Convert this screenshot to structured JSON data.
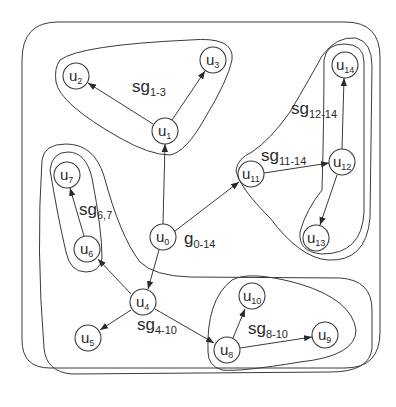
{
  "diagram": {
    "type": "hierarchical-subgraph-graph",
    "graph_label": {
      "main": "g",
      "sub": "0-14",
      "x": 184,
      "y": 244
    },
    "nodes": [
      {
        "id": "u0",
        "main": "u",
        "sub": "0",
        "x": 163,
        "y": 237
      },
      {
        "id": "u1",
        "main": "u",
        "sub": "1",
        "x": 165,
        "y": 131
      },
      {
        "id": "u2",
        "main": "u",
        "sub": "2",
        "x": 76,
        "y": 76
      },
      {
        "id": "u3",
        "main": "u",
        "sub": "3",
        "x": 213,
        "y": 60
      },
      {
        "id": "u4",
        "main": "u",
        "sub": "4",
        "x": 143,
        "y": 302
      },
      {
        "id": "u5",
        "main": "u",
        "sub": "5",
        "x": 88,
        "y": 338
      },
      {
        "id": "u6",
        "main": "u",
        "sub": "6",
        "x": 87,
        "y": 249
      },
      {
        "id": "u7",
        "main": "u",
        "sub": "7",
        "x": 67,
        "y": 175
      },
      {
        "id": "u8",
        "main": "u",
        "sub": "8",
        "x": 227,
        "y": 350
      },
      {
        "id": "u9",
        "main": "u",
        "sub": "9",
        "x": 325,
        "y": 335
      },
      {
        "id": "u10",
        "main": "u",
        "sub": "10",
        "x": 252,
        "y": 296
      },
      {
        "id": "u11",
        "main": "u",
        "sub": "11",
        "x": 251,
        "y": 174
      },
      {
        "id": "u12",
        "main": "u",
        "sub": "12",
        "x": 342,
        "y": 162
      },
      {
        "id": "u13",
        "main": "u",
        "sub": "13",
        "x": 316,
        "y": 238
      },
      {
        "id": "u14",
        "main": "u",
        "sub": "14",
        "x": 345,
        "y": 65
      }
    ],
    "edges": [
      {
        "from": "u0",
        "to": "u1"
      },
      {
        "from": "u0",
        "to": "u11"
      },
      {
        "from": "u0",
        "to": "u4"
      },
      {
        "from": "u1",
        "to": "u2"
      },
      {
        "from": "u1",
        "to": "u3"
      },
      {
        "from": "u4",
        "to": "u6"
      },
      {
        "from": "u4",
        "to": "u5"
      },
      {
        "from": "u4",
        "to": "u8"
      },
      {
        "from": "u6",
        "to": "u7"
      },
      {
        "from": "u8",
        "to": "u10"
      },
      {
        "from": "u8",
        "to": "u9"
      },
      {
        "from": "u11",
        "to": "u12"
      },
      {
        "from": "u12",
        "to": "u14"
      },
      {
        "from": "u12",
        "to": "u13"
      }
    ],
    "subgraphs": [
      {
        "id": "sg1-3",
        "main": "sg",
        "sub": "1-3",
        "label_x": 132,
        "label_y": 92
      },
      {
        "id": "sg6,7",
        "main": "sg",
        "sub": "6,7",
        "label_x": 79,
        "label_y": 215
      },
      {
        "id": "sg4-10",
        "main": "sg",
        "sub": "4-10",
        "label_x": 137,
        "label_y": 330
      },
      {
        "id": "sg8-10",
        "main": "sg",
        "sub": "8-10",
        "label_x": 248,
        "label_y": 334
      },
      {
        "id": "sg11-14",
        "main": "sg",
        "sub": "11-14",
        "label_x": 261,
        "label_y": 161
      },
      {
        "id": "sg12-14",
        "main": "sg",
        "sub": "12-14",
        "label_x": 291,
        "label_y": 114
      }
    ],
    "colors": {
      "stroke": "#3a3a3a",
      "background": "#ffffff",
      "text": "#2a2a2a"
    }
  }
}
